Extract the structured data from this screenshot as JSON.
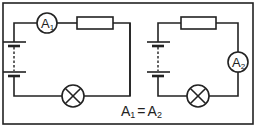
{
  "diagram": {
    "type": "circuit-comparison",
    "circuits": [
      {
        "id": "left",
        "components": [
          "battery",
          "ammeter",
          "resistor",
          "lamp"
        ],
        "ammeter": {
          "letter": "A",
          "sub": "1"
        }
      },
      {
        "id": "right",
        "components": [
          "battery",
          "resistor",
          "ammeter",
          "lamp"
        ],
        "ammeter": {
          "letter": "A",
          "sub": "2"
        }
      }
    ],
    "caption": {
      "lhs_letter": "A",
      "lhs_sub": "1",
      "eq": "=",
      "rhs_letter": "A",
      "rhs_sub": "2"
    },
    "colors": {
      "line": "#222222",
      "background": "#ffffff"
    }
  }
}
